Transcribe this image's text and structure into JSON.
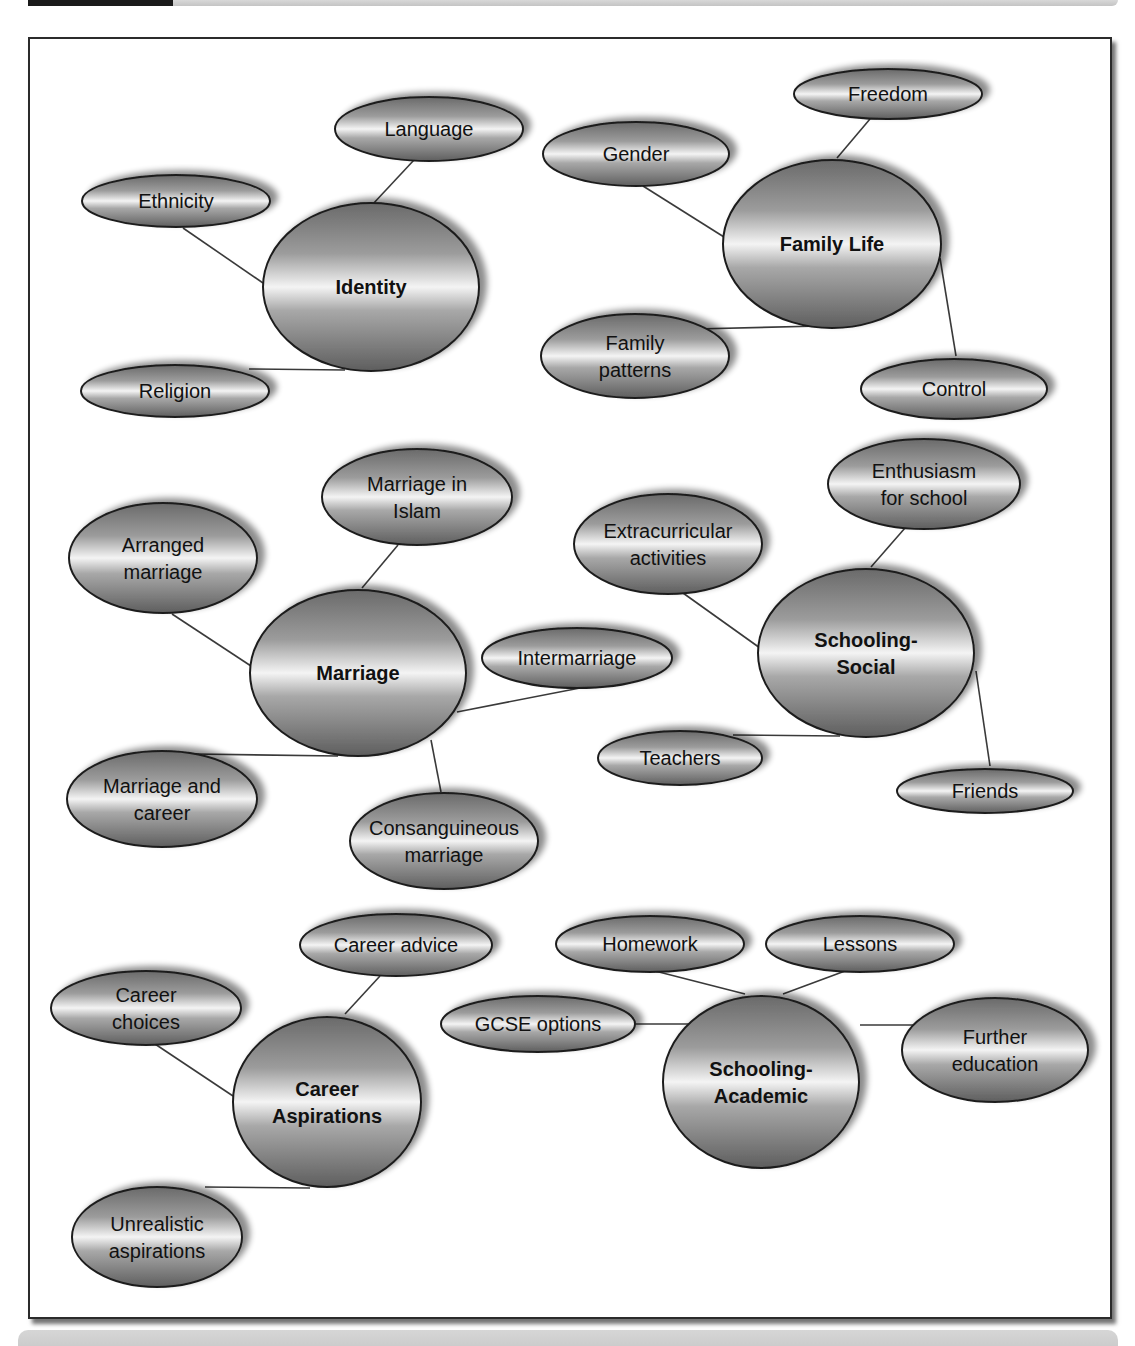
{
  "page": {
    "header_tab_color": "#1a1a1a",
    "header_bar_color": "#cfcfcf",
    "footer_bar_color": "#d0d0d0",
    "frame_border_color": "#2b2b2b"
  },
  "diagram": {
    "type": "mind-map",
    "gradient": {
      "dark": "#6e6e6e",
      "mid": "#9a9a9a",
      "light": "#f2f2f2"
    },
    "clusters": [
      {
        "id": "identity",
        "hub": {
          "label_lines": [
            "Identity"
          ],
          "cx": 371,
          "cy": 287,
          "rx": 108,
          "ry": 84
        },
        "leaves": [
          {
            "label_lines": [
              "Language"
            ],
            "cx": 429,
            "cy": 129,
            "rx": 94,
            "ry": 32,
            "edge": [
              [
                414,
                160
              ],
              [
                372,
                205
              ]
            ]
          },
          {
            "label_lines": [
              "Ethnicity"
            ],
            "cx": 176,
            "cy": 201,
            "rx": 94,
            "ry": 26,
            "edge": [
              [
                183,
                228
              ],
              [
                263,
                283
              ]
            ]
          },
          {
            "label_lines": [
              "Religion"
            ],
            "cx": 175,
            "cy": 391,
            "rx": 94,
            "ry": 26,
            "edge": [
              [
                249,
                369
              ],
              [
                345,
                370
              ]
            ]
          }
        ]
      },
      {
        "id": "family-life",
        "hub": {
          "label_lines": [
            "Family Life"
          ],
          "cx": 832,
          "cy": 244,
          "rx": 109,
          "ry": 84
        },
        "leaves": [
          {
            "label_lines": [
              "Freedom"
            ],
            "cx": 888,
            "cy": 94,
            "rx": 94,
            "ry": 25,
            "edge": [
              [
                870,
                119
              ],
              [
                837,
                158
              ]
            ]
          },
          {
            "label_lines": [
              "Gender"
            ],
            "cx": 636,
            "cy": 154,
            "rx": 93,
            "ry": 32,
            "edge": [
              [
                643,
                186
              ],
              [
                724,
                237
              ]
            ]
          },
          {
            "label_lines": [
              "Family",
              "patterns"
            ],
            "cx": 635,
            "cy": 356,
            "rx": 94,
            "ry": 42,
            "edge": [
              [
                695,
                329
              ],
              [
                820,
                326
              ]
            ]
          },
          {
            "label_lines": [
              "Control"
            ],
            "cx": 954,
            "cy": 389,
            "rx": 93,
            "ry": 30,
            "edge": [
              [
                940,
                258
              ],
              [
                956,
                356
              ]
            ]
          }
        ]
      },
      {
        "id": "marriage",
        "hub": {
          "label_lines": [
            "Marriage"
          ],
          "cx": 358,
          "cy": 673,
          "rx": 108,
          "ry": 83
        },
        "leaves": [
          {
            "label_lines": [
              "Marriage in",
              "Islam"
            ],
            "cx": 417,
            "cy": 497,
            "rx": 95,
            "ry": 48,
            "edge": [
              [
                398,
                545
              ],
              [
                362,
                588
              ]
            ]
          },
          {
            "label_lines": [
              "Arranged",
              "marriage"
            ],
            "cx": 163,
            "cy": 558,
            "rx": 94,
            "ry": 55,
            "edge": [
              [
                172,
                614
              ],
              [
                251,
                666
              ]
            ]
          },
          {
            "label_lines": [
              "Intermarriage"
            ],
            "cx": 577,
            "cy": 658,
            "rx": 95,
            "ry": 30,
            "edge": [
              [
                580,
                688
              ],
              [
                457,
                712
              ]
            ]
          },
          {
            "label_lines": [
              "Marriage and",
              "career"
            ],
            "cx": 162,
            "cy": 799,
            "rx": 95,
            "ry": 48,
            "edge": [
              [
                193,
                754
              ],
              [
                338,
                756
              ]
            ]
          },
          {
            "label_lines": [
              "Consanguineous",
              "marriage"
            ],
            "cx": 444,
            "cy": 841,
            "rx": 94,
            "ry": 48,
            "edge": [
              [
                431,
                740
              ],
              [
                441,
                792
              ]
            ]
          }
        ]
      },
      {
        "id": "schooling-social",
        "hub": {
          "label_lines": [
            "Schooling-",
            "Social"
          ],
          "cx": 866,
          "cy": 653,
          "rx": 108,
          "ry": 84
        },
        "leaves": [
          {
            "label_lines": [
              "Enthusiasm",
              "for school"
            ],
            "cx": 924,
            "cy": 484,
            "rx": 96,
            "ry": 45,
            "edge": [
              [
                905,
                528
              ],
              [
                871,
                567
              ]
            ]
          },
          {
            "label_lines": [
              "Extracurricular",
              "activities"
            ],
            "cx": 668,
            "cy": 544,
            "rx": 94,
            "ry": 50,
            "edge": [
              [
                683,
                593
              ],
              [
                760,
                648
              ]
            ]
          },
          {
            "label_lines": [
              "Teachers"
            ],
            "cx": 680,
            "cy": 758,
            "rx": 82,
            "ry": 27,
            "edge": [
              [
                733,
                735
              ],
              [
                840,
                736
              ]
            ]
          },
          {
            "label_lines": [
              "Friends"
            ],
            "cx": 985,
            "cy": 791,
            "rx": 88,
            "ry": 22,
            "edge": [
              [
                976,
                671
              ],
              [
                990,
                766
              ]
            ]
          }
        ]
      },
      {
        "id": "career-aspirations",
        "hub": {
          "label_lines": [
            "Career",
            "Aspirations"
          ],
          "cx": 327,
          "cy": 1102,
          "rx": 94,
          "ry": 85
        },
        "leaves": [
          {
            "label_lines": [
              "Career advice"
            ],
            "cx": 396,
            "cy": 945,
            "rx": 96,
            "ry": 31,
            "edge": [
              [
                380,
                976
              ],
              [
                345,
                1014
              ]
            ]
          },
          {
            "label_lines": [
              "Career",
              "choices"
            ],
            "cx": 146,
            "cy": 1008,
            "rx": 95,
            "ry": 37,
            "edge": [
              [
                155,
                1044
              ],
              [
                233,
                1096
              ]
            ]
          },
          {
            "label_lines": [
              "Unrealistic",
              "aspirations"
            ],
            "cx": 157,
            "cy": 1237,
            "rx": 85,
            "ry": 50,
            "edge": [
              [
                205,
                1187
              ],
              [
                310,
                1188
              ]
            ]
          }
        ]
      },
      {
        "id": "schooling-academic",
        "hub": {
          "label_lines": [
            "Schooling-",
            "Academic"
          ],
          "cx": 761,
          "cy": 1082,
          "rx": 98,
          "ry": 86
        },
        "leaves": [
          {
            "label_lines": [
              "Homework"
            ],
            "cx": 650,
            "cy": 944,
            "rx": 94,
            "ry": 28,
            "edge": [
              [
                655,
                971
              ],
              [
                745,
                994
              ]
            ]
          },
          {
            "label_lines": [
              "Lessons"
            ],
            "cx": 860,
            "cy": 944,
            "rx": 94,
            "ry": 28,
            "edge": [
              [
                845,
                971
              ],
              [
                783,
                994
              ]
            ]
          },
          {
            "label_lines": [
              "GCSE options"
            ],
            "cx": 538,
            "cy": 1024,
            "rx": 97,
            "ry": 28,
            "edge": [
              [
                634,
                1024
              ],
              [
                700,
                1024
              ]
            ]
          },
          {
            "label_lines": [
              "Further",
              "education"
            ],
            "cx": 995,
            "cy": 1050,
            "rx": 93,
            "ry": 52,
            "edge": [
              [
                860,
                1025
              ],
              [
                920,
                1025
              ]
            ]
          }
        ]
      }
    ]
  }
}
